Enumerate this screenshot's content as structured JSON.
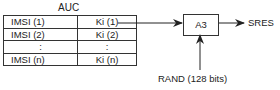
{
  "diagram": {
    "title": "AUC",
    "table": {
      "rows": [
        {
          "imsi": "IMSI (1)",
          "ki": "Ki (1)"
        },
        {
          "imsi": "IMSI (2)",
          "ki": "Ki (2)"
        },
        {
          "imsi": ":",
          "ki": ":"
        },
        {
          "imsi": "IMSI (n)",
          "ki": "Ki (n)"
        }
      ]
    },
    "algorithm_box": "A3",
    "output_label": "SRES",
    "input_label": "RAND (128 bits)"
  }
}
